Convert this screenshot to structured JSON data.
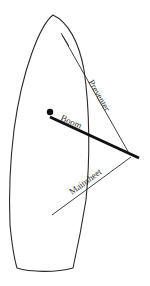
{
  "diagram": {
    "labels": {
      "preventer": "Preventer",
      "boom": "Boom",
      "mainsheet": "Mainsheet"
    },
    "colors": {
      "line": "#2a2a2a",
      "boom": "#111111",
      "background": "#ffffff"
    }
  }
}
